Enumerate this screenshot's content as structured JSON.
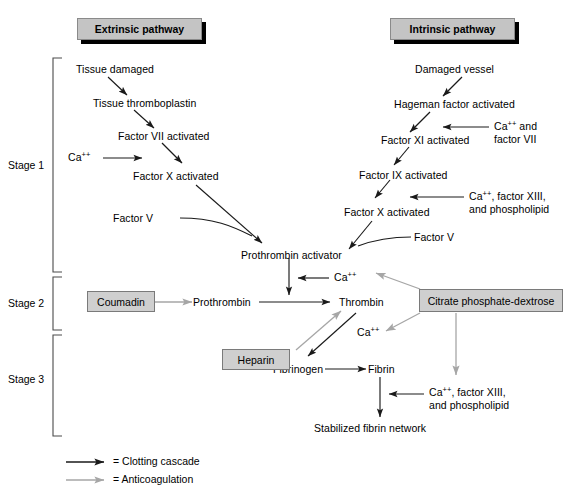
{
  "figure": {
    "colors": {
      "clotting_arrow": "#1a1a1a",
      "anticoagulation_arrow": "#a6a6a6",
      "banner_fill": "#c4c4c4",
      "box_fill": "#cfcfcf",
      "background": "#ffffff"
    }
  },
  "banners": [
    {
      "id": "extrinsic",
      "label": "Extrinsic pathway"
    },
    {
      "id": "intrinsic",
      "label": "Intrinsic pathway"
    }
  ],
  "stages": [
    {
      "id": "stage1",
      "label": "Stage 1"
    },
    {
      "id": "stage2",
      "label": "Stage 2"
    },
    {
      "id": "stage3",
      "label": "Stage 3"
    }
  ],
  "extrinsic_pathway": {
    "nodes": [
      {
        "id": "tissue-damaged",
        "label": "Tissue damaged"
      },
      {
        "id": "tissue-thromboplastin",
        "label": "Tissue thromboplastin"
      },
      {
        "id": "factor-vii-activated",
        "label": "Factor VII activated"
      },
      {
        "id": "calcium-extrinsic",
        "label": "Ca",
        "sup": "++"
      },
      {
        "id": "factor-x-activated-extrinsic",
        "label": "Factor X activated"
      },
      {
        "id": "factor-v-extrinsic",
        "label": "Factor V"
      }
    ]
  },
  "intrinsic_pathway": {
    "nodes": [
      {
        "id": "damaged-vessel",
        "label": "Damaged vessel"
      },
      {
        "id": "hageman-factor-activated",
        "label": "Hageman factor activated"
      },
      {
        "id": "calcium-and-factor-vii",
        "line1": "Ca",
        "sup": "++",
        "line1_tail": " and",
        "line2": "factor VII"
      },
      {
        "id": "factor-xi-activated",
        "label": "Factor XI activated"
      },
      {
        "id": "factor-ix-activated",
        "label": "Factor IX activated"
      },
      {
        "id": "calcium-factor-xiii-phospholipid-upper",
        "line1": "Ca",
        "sup": "++",
        "line1_tail": ", factor XIII,",
        "line2": "and phospholipid"
      },
      {
        "id": "factor-x-activated-intrinsic",
        "label": "Factor X activated"
      },
      {
        "id": "factor-v-intrinsic",
        "label": "Factor V"
      }
    ]
  },
  "common_pathway": {
    "nodes": [
      {
        "id": "prothrombin-activator",
        "label": "Prothrombin activator"
      },
      {
        "id": "calcium-stage2",
        "label": "Ca",
        "sup": "++"
      },
      {
        "id": "prothrombin",
        "label": "Prothrombin"
      },
      {
        "id": "thrombin",
        "label": "Thrombin"
      },
      {
        "id": "calcium-stage3",
        "label": "Ca",
        "sup": "++"
      },
      {
        "id": "fibrinogen",
        "label": "Fibrinogen"
      },
      {
        "id": "fibrin",
        "label": "Fibrin"
      },
      {
        "id": "calcium-factor-xiii-phospholipid-lower",
        "line1": "Ca",
        "sup": "++",
        "line1_tail": ", factor XIII,",
        "line2": "and phospholipid"
      },
      {
        "id": "stabilized-fibrin-network",
        "label": "Stabilized fibrin network"
      }
    ]
  },
  "boxes": [
    {
      "id": "coumadin",
      "label": "Coumadin"
    },
    {
      "id": "heparin",
      "label": "Heparin"
    },
    {
      "id": "citrate-phosphate-dextrose",
      "label": "Citrate phosphate-dextrose"
    }
  ],
  "legend": {
    "items": [
      {
        "id": "clotting-cascade",
        "label": "= Clotting cascade",
        "color": "#1a1a1a"
      },
      {
        "id": "anticoagulation",
        "label": "= Anticoagulation",
        "color": "#a6a6a6"
      }
    ]
  }
}
